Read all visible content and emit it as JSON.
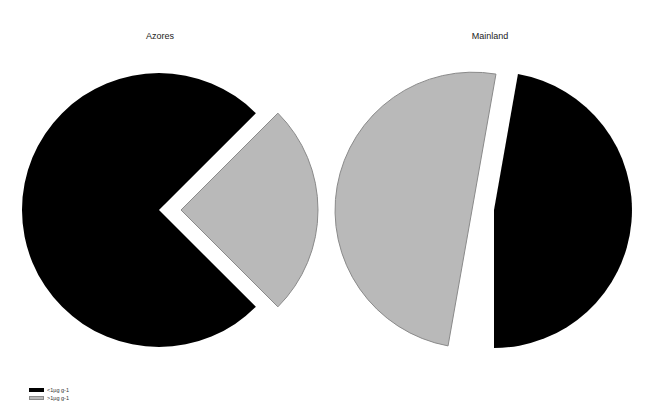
{
  "chart_data": {
    "type": "pie",
    "legend": {
      "position": "bottom-left",
      "entries": [
        {
          "label": "<1µg g-1",
          "color": "#000000"
        },
        {
          "label": ">1µg g-1",
          "color": "#b9b9b9"
        }
      ]
    },
    "charts": [
      {
        "title": "Azores",
        "slices": [
          {
            "label": "<1µg g-1",
            "value": 75,
            "color": "#000000",
            "exploded": false
          },
          {
            "label": ">1µg g-1",
            "value": 25,
            "color": "#b9b9b9",
            "exploded": true
          }
        ]
      },
      {
        "title": "Mainland",
        "slices": [
          {
            "label": "<1µg g-1",
            "value": 47,
            "color": "#000000",
            "exploded": true
          },
          {
            "label": ">1µg g-1",
            "value": 53,
            "color": "#b9b9b9",
            "exploded": false
          }
        ]
      }
    ]
  },
  "geometry": {
    "azores": {
      "black": {
        "cx": 159,
        "cy": 210,
        "r": 137,
        "start": 135,
        "end": 405
      },
      "gray": {
        "cx": 181,
        "cy": 210,
        "r": 137,
        "start": 45,
        "end": 135
      }
    },
    "mainland": {
      "black": {
        "cx": 494,
        "cy": 210,
        "r": 138,
        "start": 10,
        "end": 180
      },
      "gray": {
        "cx": 472,
        "cy": 210,
        "r": 138,
        "start": 190,
        "end": 370
      }
    }
  },
  "outline_color": "#8a8a8a"
}
